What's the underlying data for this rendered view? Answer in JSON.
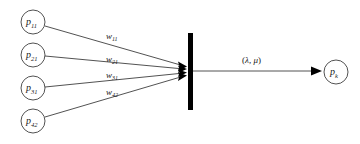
{
  "diagram": {
    "background_color": "#ffffff",
    "stroke_color": "#262626",
    "barrier_color": "#000000"
  },
  "input_nodes": [
    {
      "id": "p11",
      "base": "p",
      "sub": "11",
      "cx": 33,
      "cy": 22,
      "r": 12
    },
    {
      "id": "p21",
      "base": "p",
      "sub": "21",
      "cx": 33,
      "cy": 55,
      "r": 12
    },
    {
      "id": "p31",
      "base": "p",
      "sub": "31",
      "cx": 33,
      "cy": 88,
      "r": 12
    },
    {
      "id": "p42",
      "base": "p",
      "sub": "42",
      "cx": 33,
      "cy": 121,
      "r": 12
    }
  ],
  "output_node": {
    "id": "pk",
    "base": "p",
    "sub": "k",
    "cx": 336,
    "cy": 72,
    "r": 12
  },
  "weights": [
    {
      "id": "w11",
      "base": "w",
      "sub": "11",
      "x": 106,
      "y": 39
    },
    {
      "id": "w21",
      "base": "w",
      "sub": "21",
      "x": 106,
      "y": 62
    },
    {
      "id": "w31",
      "base": "w",
      "sub": "31",
      "x": 106,
      "y": 78
    },
    {
      "id": "w42",
      "base": "w",
      "sub": "42",
      "x": 106,
      "y": 95
    }
  ],
  "barrier": {
    "x": 188,
    "y": 33,
    "width": 5,
    "height": 77
  },
  "output_edge": {
    "label_open": "(",
    "label_lambda": "λ",
    "label_comma": ", ",
    "label_mu": "μ",
    "label_close": ")",
    "label_x": 252,
    "label_y": 63,
    "start_x": 193,
    "end_x": 318,
    "y": 71
  },
  "edges": [
    {
      "id": "edge-p11",
      "x1": 45,
      "y1": 26,
      "x2": 186,
      "y2": 66
    },
    {
      "id": "edge-p21",
      "x1": 45,
      "y1": 56,
      "x2": 186,
      "y2": 69
    },
    {
      "id": "edge-p31",
      "x1": 45,
      "y1": 87,
      "x2": 186,
      "y2": 73
    },
    {
      "id": "edge-p42",
      "x1": 45,
      "y1": 117,
      "x2": 186,
      "y2": 76
    }
  ]
}
